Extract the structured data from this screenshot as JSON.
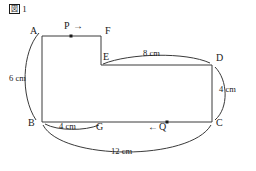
{
  "figure": {
    "caption_box": "図",
    "caption_number": "1",
    "stroke_color": "#3a3a3a",
    "text_color": "#1a1a1a",
    "background": "#ffffff"
  },
  "vertices": [
    {
      "name": "A",
      "label": "A",
      "x": 42,
      "y": 36,
      "label_x": 30,
      "label_y": 27
    },
    {
      "name": "F",
      "label": "F",
      "x": 101,
      "y": 36,
      "label_x": 105,
      "label_y": 27
    },
    {
      "name": "E",
      "label": "E",
      "x": 101,
      "y": 65,
      "label_x": 103,
      "label_y": 55
    },
    {
      "name": "D",
      "label": "D",
      "x": 212,
      "y": 65,
      "label_x": 216,
      "label_y": 56
    },
    {
      "name": "C",
      "label": "C",
      "x": 212,
      "y": 122,
      "label_x": 216,
      "label_y": 121
    },
    {
      "name": "B",
      "label": "B",
      "x": 42,
      "y": 122,
      "label_x": 29,
      "label_y": 121
    },
    {
      "name": "G",
      "label": "G",
      "x": 101,
      "y": 122,
      "label_x": 97,
      "label_y": 124
    }
  ],
  "moving_points": [
    {
      "name": "P",
      "label": "P",
      "arrow": "→",
      "dot_x": 71,
      "dot_y": 36,
      "label_x": 65,
      "label_y": 22,
      "direction": "right",
      "on_segment": "AF"
    },
    {
      "name": "Q",
      "label": "Q",
      "arrow": "←",
      "dot_x": 167,
      "dot_y": 122,
      "label_x": 156,
      "label_y": 124,
      "direction": "left",
      "on_segment": "CB"
    }
  ],
  "measurements": [
    {
      "name": "AB",
      "text": "6 cm",
      "label_x": 10,
      "label_y": 77
    },
    {
      "name": "ED",
      "text": "8 cm",
      "label_x": 144,
      "label_y": 52
    },
    {
      "name": "DC",
      "text": "4 cm",
      "label_x": 220,
      "label_y": 88
    },
    {
      "name": "BG",
      "text": "4 cm",
      "label_x": 60,
      "label_y": 124
    },
    {
      "name": "BC",
      "text": "12 cm",
      "label_x": 112,
      "label_y": 150
    }
  ]
}
